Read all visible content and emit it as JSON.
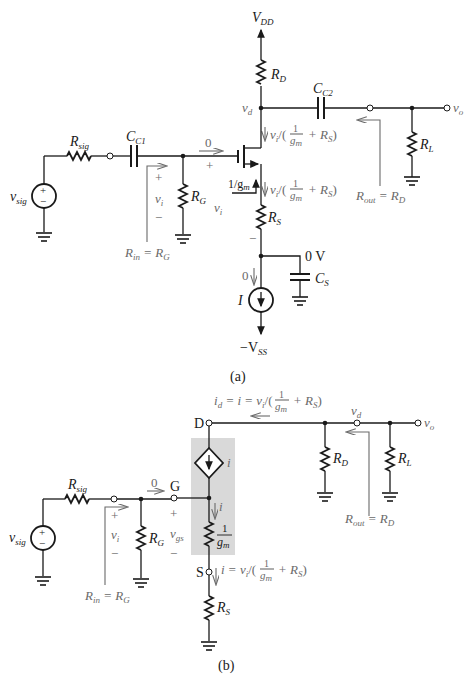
{
  "figure_a": {
    "caption": "(a)",
    "labels": {
      "vdd": "V",
      "vdd_sub": "DD",
      "rd": "R",
      "rd_sub": "D",
      "cc2": "C",
      "cc2_sub": "C2",
      "vd": "v",
      "vd_sub": "d",
      "vo": "v",
      "vo_sub": "o",
      "rl": "R",
      "rl_sub": "L",
      "rsig": "R",
      "rsig_sub": "sig",
      "cc1": "C",
      "cc1_sub": "C1",
      "vsig": "v",
      "vsig_sub": "sig",
      "rg": "R",
      "rg_sub": "G",
      "rs": "R",
      "rs_sub": "S",
      "cs": "C",
      "cs_sub": "S",
      "i_source": "I",
      "vss": "−V",
      "vss_sub": "SS",
      "zero_v": "0 V",
      "gate_current": "0",
      "source_current": "0",
      "vi": "v",
      "vi_sub": "i",
      "plus": "+",
      "minus": "−",
      "rin": "R",
      "rin_sub": "in",
      "rin_eq": " = R",
      "rin_eq_sub": "G",
      "rout": "R",
      "rout_sub": "out",
      "rout_eq": " = R",
      "rout_eq_sub": "D",
      "one_over_gm": "1/g",
      "one_over_gm_sub": "m",
      "drain_current_expr": "v",
      "drain_current_expr_sub": "i",
      "expr_slash": "/(",
      "expr_num": "1",
      "expr_den": "g",
      "expr_den_sub": "m",
      "expr_tail": "+ R",
      "expr_tail_sub": "S",
      "expr_close": ")"
    }
  },
  "figure_b": {
    "caption": "(b)",
    "labels": {
      "d_node": "D",
      "g_node": "G",
      "s_node": "S",
      "id_expr_head": "i",
      "id_expr_head_sub": "d",
      "id_expr_mid": " = i = v",
      "id_expr_mid_sub": "i",
      "expr_slash": "/(",
      "expr_num": "1",
      "expr_den": "g",
      "expr_den_sub": "m",
      "expr_tail": "+ R",
      "expr_tail_sub": "S",
      "expr_close": ")",
      "s_expr_head": "i = v",
      "s_expr_head_sub": "i",
      "dep_source": "i",
      "branch_current": "i",
      "gm_res_num": "1",
      "gm_res_den": "g",
      "gm_res_den_sub": "m",
      "vd": "v",
      "vd_sub": "d",
      "vo": "v",
      "vo_sub": "o",
      "rd": "R",
      "rd_sub": "D",
      "rl": "R",
      "rl_sub": "L",
      "rsig": "R",
      "rsig_sub": "sig",
      "vsig": "v",
      "vsig_sub": "sig",
      "rg": "R",
      "rg_sub": "G",
      "rs": "R",
      "rs_sub": "S",
      "vi": "v",
      "vi_sub": "i",
      "vgs": "v",
      "vgs_sub": "gs",
      "gate_current": "0",
      "plus": "+",
      "minus": "−",
      "rin": "R",
      "rin_sub": "in",
      "rin_eq": " = R",
      "rin_eq_sub": "G",
      "rout": "R",
      "rout_sub": "out",
      "rout_eq": " = R",
      "rout_eq_sub": "D"
    }
  },
  "colors": {
    "wire": "#1a1a1a",
    "annotation": "#6a6a6a",
    "shade": "#d9d9d9"
  }
}
